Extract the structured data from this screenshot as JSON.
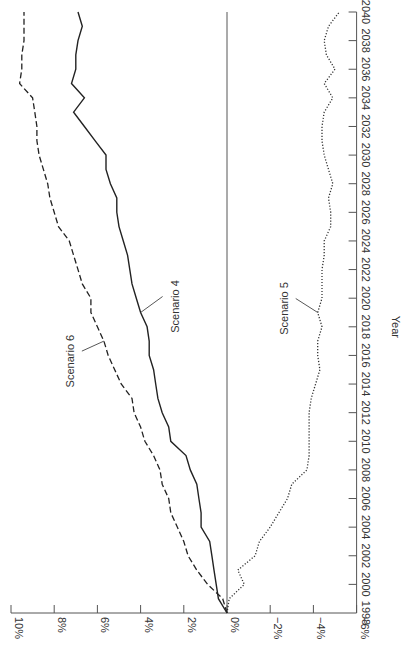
{
  "chart_data": {
    "type": "line",
    "orientation": "rotated 90 degrees clockwise (year axis vertical on right, percent axis horizontal at bottom)",
    "title": "",
    "xlabel": "Year",
    "ylabel": "",
    "x": [
      1998,
      1999,
      2000,
      2001,
      2002,
      2003,
      2004,
      2005,
      2006,
      2007,
      2008,
      2009,
      2010,
      2011,
      2012,
      2013,
      2014,
      2015,
      2016,
      2017,
      2018,
      2019,
      2020,
      2021,
      2022,
      2023,
      2024,
      2025,
      2026,
      2027,
      2028,
      2029,
      2030,
      2031,
      2032,
      2033,
      2034,
      2035,
      2036,
      2037,
      2038,
      2039,
      2040
    ],
    "xlim": [
      1998,
      2040
    ],
    "ylim": [
      -6,
      10
    ],
    "x_ticks": [
      "1998",
      "2000",
      "2002",
      "2004",
      "2006",
      "2008",
      "2010",
      "2012",
      "2014",
      "2016",
      "2018",
      "2020",
      "2022",
      "2024",
      "2026",
      "2028",
      "2030",
      "2032",
      "2034",
      "2036",
      "2038",
      "2040"
    ],
    "y_ticks": [
      {
        "value": 10,
        "label": "10%"
      },
      {
        "value": 8,
        "label": "8%"
      },
      {
        "value": 6,
        "label": "6%"
      },
      {
        "value": 4,
        "label": "4%"
      },
      {
        "value": 2,
        "label": "2%"
      },
      {
        "value": 0,
        "label": "0%"
      },
      {
        "value": -2,
        "label": "−2%"
      },
      {
        "value": -4,
        "label": "−4%"
      },
      {
        "value": -6,
        "label": "−6%"
      }
    ],
    "grid": false,
    "reference_line": {
      "value": 0
    },
    "legend": "none (direct labels)",
    "series": [
      {
        "name": "Scenario 4",
        "style": "solid",
        "label_year": 2019,
        "values": [
          0.0,
          0.4,
          0.5,
          0.6,
          0.7,
          0.8,
          1.2,
          1.2,
          1.3,
          1.4,
          1.7,
          1.9,
          2.6,
          2.7,
          3.0,
          3.2,
          3.3,
          3.4,
          3.6,
          3.6,
          3.7,
          4.0,
          4.2,
          4.4,
          4.5,
          4.6,
          4.8,
          5.0,
          5.1,
          5.1,
          5.4,
          5.6,
          5.6,
          6.1,
          6.6,
          7.1,
          6.6,
          7.2,
          7.0,
          7.0,
          6.9,
          6.7,
          6.9
        ]
      },
      {
        "name": "Scenario 5",
        "style": "dotted",
        "label_year": 2019,
        "values": [
          0.0,
          -0.1,
          -0.8,
          -0.5,
          -1.3,
          -1.5,
          -2.0,
          -2.4,
          -2.8,
          -3.0,
          -3.7,
          -3.8,
          -3.8,
          -3.8,
          -3.8,
          -3.9,
          -4.1,
          -4.3,
          -4.2,
          -4.2,
          -4.4,
          -4.2,
          -4.4,
          -4.4,
          -4.4,
          -4.5,
          -4.5,
          -4.8,
          -4.8,
          -4.7,
          -4.9,
          -4.7,
          -4.5,
          -4.4,
          -4.4,
          -4.5,
          -4.9,
          -4.5,
          -5.0,
          -4.6,
          -4.5,
          -4.7,
          -5.2
        ]
      },
      {
        "name": "Scenario 6",
        "style": "dashed",
        "label_year": 2017,
        "values": [
          0.0,
          0.2,
          0.9,
          1.4,
          1.8,
          2.0,
          2.3,
          2.6,
          2.7,
          3.0,
          3.1,
          3.4,
          3.8,
          4.0,
          4.3,
          4.4,
          4.9,
          5.2,
          5.5,
          5.7,
          6.0,
          6.3,
          6.3,
          6.7,
          6.9,
          7.1,
          7.3,
          7.8,
          8.0,
          8.2,
          8.3,
          8.5,
          8.7,
          8.8,
          8.8,
          8.9,
          9.0,
          9.6,
          9.5,
          9.5,
          9.4,
          9.4,
          9.4
        ]
      }
    ]
  }
}
